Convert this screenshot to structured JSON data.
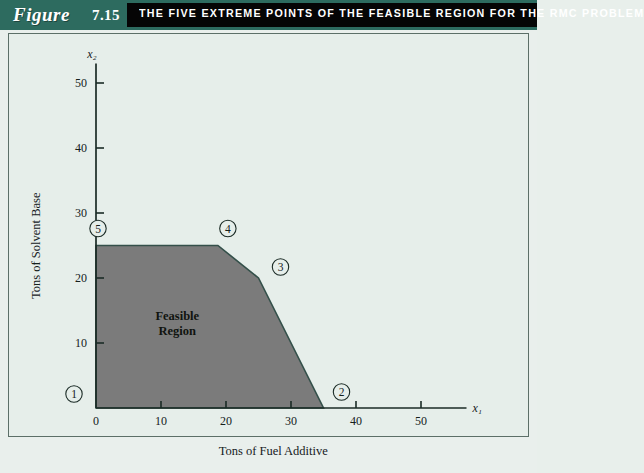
{
  "banner": {
    "figure_word": "Figure",
    "figure_number": "7.15",
    "title": "THE FIVE EXTREME POINTS OF THE FEASIBLE REGION FOR THE RMC PROBLEM",
    "teal_color": "#2d6b5f",
    "black_color": "#050505",
    "text_color": "#ffffff"
  },
  "chart_data": {
    "type": "area",
    "title": "THE FIVE EXTREME POINTS OF THE FEASIBLE REGION FOR THE RMC PROBLEM",
    "xlabel": "Tons of Fuel Additive",
    "ylabel": "Tons of Solvent Base",
    "x_var": "x₁",
    "y_var": "x₂",
    "xlim": [
      0,
      57
    ],
    "ylim": [
      0,
      53
    ],
    "xticks": [
      0,
      10,
      20,
      30,
      40,
      50
    ],
    "xtick_labels": [
      "0",
      "10",
      "20",
      "30",
      "40",
      "50"
    ],
    "yticks": [
      10,
      20,
      30,
      40,
      50
    ],
    "ytick_labels": [
      "10",
      "20",
      "30",
      "40",
      "50"
    ],
    "grid": false,
    "legend": "none",
    "region_label_line1": "Feasible",
    "region_label_line2": "Region",
    "region_fill_color": "#7b7b7b",
    "region_edge_color": "#34504a",
    "polygon_vertices": [
      {
        "x": 0,
        "y": 0
      },
      {
        "x": 35,
        "y": 0
      },
      {
        "x": 25,
        "y": 20
      },
      {
        "x": 18.75,
        "y": 25
      },
      {
        "x": 0,
        "y": 25
      }
    ],
    "extreme_points": [
      {
        "id": "1",
        "x": 0,
        "y": 0,
        "label_dx": -22,
        "label_dy": -14
      },
      {
        "id": "2",
        "x": 35,
        "y": 0,
        "label_dx": 18,
        "label_dy": -16
      },
      {
        "id": "3",
        "x": 25,
        "y": 20,
        "label_dx": 22,
        "label_dy": -11
      },
      {
        "id": "4",
        "x": 18.75,
        "y": 25,
        "label_dx": 10,
        "label_dy": -17
      },
      {
        "id": "5",
        "x": 0,
        "y": 25,
        "label_dx": 2,
        "label_dy": -17
      }
    ]
  }
}
